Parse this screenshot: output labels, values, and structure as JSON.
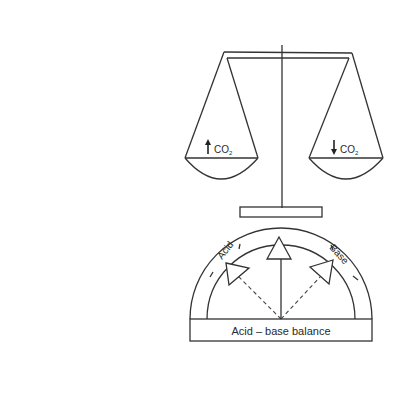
{
  "scale": {
    "left_pan": {
      "label": "CO",
      "subscript": "2",
      "arrow": "up"
    },
    "right_pan": {
      "label": "CO",
      "subscript": "2",
      "arrow": "down"
    }
  },
  "gauge": {
    "left_label": "Acid",
    "right_label": "Base",
    "base_label": "Acid – base balance"
  },
  "colors": {
    "line": "#333333",
    "background": "#ffffff"
  }
}
